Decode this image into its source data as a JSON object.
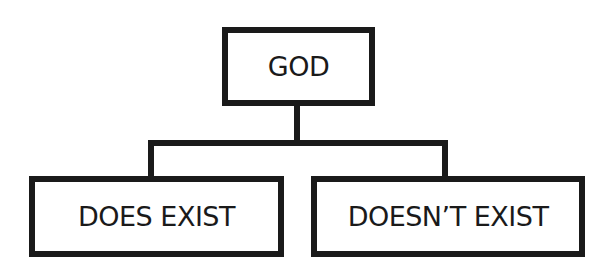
{
  "diagram": {
    "type": "tree",
    "root": {
      "label": "GOD"
    },
    "children": [
      {
        "label": "DOES EXIST"
      },
      {
        "label": "DOESN’T EXIST"
      }
    ],
    "colors": {
      "stroke": "#1a1a1a",
      "fill": "#ffffff",
      "text": "#1a1a1a"
    }
  }
}
